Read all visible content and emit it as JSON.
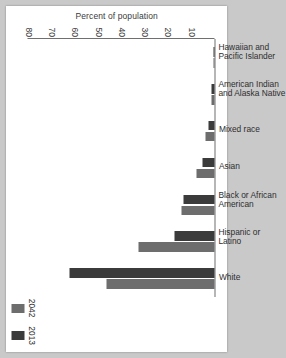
{
  "chart_data": {
    "type": "bar",
    "title": "",
    "xlabel": "",
    "ylabel": "Percent of population",
    "categories": [
      "Hawaiian and\nPacific Islander",
      "American Indian\nand Alaska Native",
      "Mixed race",
      "Asian",
      "Black or African\nAmerican",
      "Hispanic or Latino",
      "White"
    ],
    "series": [
      {
        "name": "2013",
        "color": "#3b3b3b",
        "values": [
          0.2,
          1.2,
          2.4,
          5.3,
          13.2,
          17.1,
          62.4
        ]
      },
      {
        "name": "2042",
        "color": "#6d6d6d",
        "values": [
          0.3,
          1.2,
          3.9,
          7.8,
          14.1,
          32.8,
          46.3
        ]
      }
    ],
    "ylim": [
      0,
      80
    ],
    "yticks": [
      10,
      20,
      30,
      40,
      50,
      60,
      70,
      80
    ],
    "grid": false,
    "legend_position": "bottom-right",
    "legend": [
      "2013",
      "2042"
    ]
  },
  "page": {
    "background_color": "#c9c9c9",
    "paper_color": "#ffffff",
    "axis_color": "#6f6f6f"
  }
}
